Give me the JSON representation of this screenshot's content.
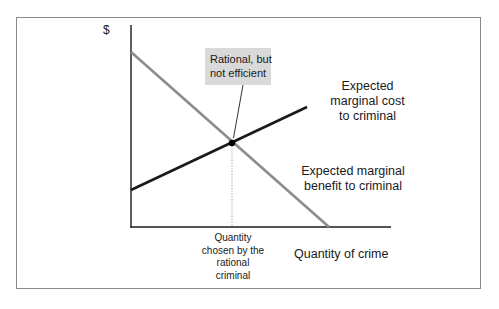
{
  "diagram": {
    "y_axis_label": "$",
    "x_axis_label": "Quantity of crime",
    "callout": {
      "lines": [
        "Rational, but",
        "not efficient"
      ],
      "background": "#d9d9d9"
    },
    "chosen_quantity_label": {
      "lines": [
        "Quantity",
        "chosen by the",
        "rational",
        "criminal"
      ]
    },
    "curves": [
      {
        "name": "Expected marginal cost to criminal",
        "label_lines": [
          "Expected",
          "marginal cost",
          "to criminal"
        ],
        "color": "#1a1a1a",
        "slope": "upward",
        "start": [
          131,
          190
        ],
        "end": [
          307,
          107
        ]
      },
      {
        "name": "Expected marginal benefit to criminal",
        "label_lines": [
          "Expected marginal",
          "benefit to criminal"
        ],
        "color": "#8c8c8c",
        "slope": "downward",
        "start": [
          131,
          52
        ],
        "end": [
          329,
          227
        ]
      }
    ],
    "intersection": [
      232,
      143
    ],
    "colors": {
      "frame": "#8a8a8a",
      "axis": "#1a1a1a",
      "cost_line": "#1a1a1a",
      "benefit_line": "#8c8c8c",
      "dotted_guide": "#9a9a9a"
    }
  }
}
